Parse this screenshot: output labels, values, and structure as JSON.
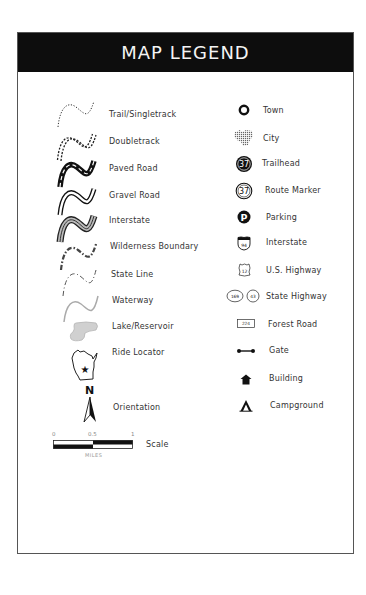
{
  "header": {
    "title": "MAP LEGEND"
  },
  "left_column": [
    {
      "label": "Trail/Singletrack",
      "icon": "trail-singletrack-icon"
    },
    {
      "label": "Doubletrack",
      "icon": "doubletrack-icon"
    },
    {
      "label": "Paved Road",
      "icon": "paved-road-icon"
    },
    {
      "label": "Gravel Road",
      "icon": "gravel-road-icon"
    },
    {
      "label": "Interstate",
      "icon": "interstate-line-icon"
    },
    {
      "label": "Wilderness Boundary",
      "icon": "wilderness-boundary-icon"
    },
    {
      "label": "State Line",
      "icon": "state-line-icon"
    },
    {
      "label": "Waterway",
      "icon": "waterway-icon"
    },
    {
      "label": "Lake/Reservoir",
      "icon": "lake-reservoir-icon"
    },
    {
      "label": "Ride Locator",
      "icon": "ride-locator-icon"
    },
    {
      "label": "Orientation",
      "icon": "north-arrow-icon"
    },
    {
      "label": "Scale",
      "icon": "scale-bar-icon"
    }
  ],
  "right_column": [
    {
      "label": "Town",
      "icon": "town-icon"
    },
    {
      "label": "City",
      "icon": "city-icon"
    },
    {
      "label": "Trailhead",
      "icon": "trailhead-icon",
      "number": "37"
    },
    {
      "label": "Route Marker",
      "icon": "route-marker-icon",
      "number": "37"
    },
    {
      "label": "Parking",
      "icon": "parking-icon",
      "glyph": "P"
    },
    {
      "label": "Interstate",
      "icon": "interstate-shield-icon",
      "number": "94"
    },
    {
      "label": "U.S. Highway",
      "icon": "us-highway-shield-icon",
      "number": "12"
    },
    {
      "label": "State Highway",
      "icon": "state-highway-icon",
      "numbers": [
        "169",
        "43"
      ]
    },
    {
      "label": "Forest Road",
      "icon": "forest-road-icon",
      "number": "224"
    },
    {
      "label": "Gate",
      "icon": "gate-icon"
    },
    {
      "label": "Building",
      "icon": "building-icon"
    },
    {
      "label": "Campground",
      "icon": "campground-icon"
    }
  ],
  "orientation": {
    "north_letter": "N"
  },
  "scale": {
    "ticks": [
      "0",
      "0.5",
      "1"
    ],
    "unit": "MILES"
  }
}
